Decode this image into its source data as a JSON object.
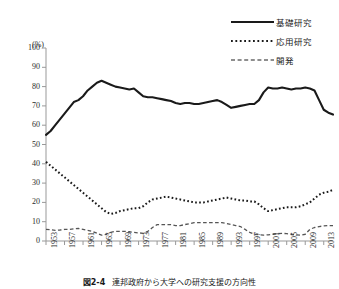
{
  "figure": {
    "caption_number": "図2-4",
    "caption_title": "連邦政府から大学への研究支援の方向性",
    "axis_unit": "(%)"
  },
  "legend": {
    "position": "top-right",
    "items": [
      {
        "label": "基礎研究",
        "style": "solid",
        "color": "#1a1a1a"
      },
      {
        "label": "応用研究",
        "style": "dotted",
        "color": "#1a1a1a"
      },
      {
        "label": "開発",
        "style": "dashed",
        "color": "#555555"
      }
    ]
  },
  "chart_data": {
    "type": "line",
    "title": "連邦政府から大学への研究支援の方向性",
    "xlabel": "",
    "ylabel": "(%)",
    "ylim": [
      0,
      100
    ],
    "yticks": [
      0,
      10,
      20,
      30,
      40,
      50,
      60,
      70,
      80,
      90,
      100
    ],
    "xlim": [
      1953,
      2015
    ],
    "xticks": [
      1953,
      1957,
      1961,
      1965,
      1969,
      1973,
      1977,
      1981,
      1985,
      1989,
      1993,
      1997,
      2001,
      2005,
      2009,
      2013
    ],
    "xtick_labels": [
      "1953",
      "1957",
      "1961",
      "1965",
      "1969",
      "1973",
      "1977",
      "1981",
      "1985",
      "1989",
      "1993",
      "1997",
      "2001",
      "2005",
      "2009",
      "2013"
    ],
    "grid": false,
    "legend_position": "top-right",
    "x": [
      1953,
      1954,
      1955,
      1956,
      1957,
      1958,
      1959,
      1960,
      1961,
      1962,
      1963,
      1964,
      1965,
      1966,
      1967,
      1968,
      1969,
      1970,
      1971,
      1972,
      1973,
      1974,
      1975,
      1976,
      1977,
      1978,
      1979,
      1980,
      1981,
      1982,
      1983,
      1984,
      1985,
      1986,
      1987,
      1988,
      1989,
      1990,
      1991,
      1992,
      1993,
      1994,
      1995,
      1996,
      1997,
      1998,
      1999,
      2000,
      2001,
      2002,
      2003,
      2004,
      2005,
      2006,
      2007,
      2008,
      2009,
      2010,
      2011,
      2012,
      2013,
      2014,
      2015
    ],
    "series": [
      {
        "name": "基礎研究",
        "style": "solid",
        "color": "#1a1a1a",
        "values": [
          55,
          57,
          60,
          63,
          66,
          69,
          72,
          73,
          75,
          78,
          80,
          82,
          83,
          82,
          81,
          80,
          79.5,
          79,
          78.5,
          79,
          77,
          75,
          74.5,
          74.5,
          74,
          73.5,
          73,
          72.5,
          71.5,
          71,
          71.5,
          71.5,
          71,
          71,
          71.5,
          72,
          72.5,
          73,
          72,
          70.5,
          69,
          69.5,
          70,
          70.5,
          71,
          71,
          73,
          77,
          79.5,
          79,
          79,
          79.5,
          79,
          78.5,
          79,
          79,
          79.5,
          79,
          78,
          73,
          68,
          66.5,
          65.5
        ]
      },
      {
        "name": "応用研究",
        "style": "dotted",
        "color": "#1a1a1a",
        "values": [
          41,
          39,
          37,
          35,
          33,
          31,
          29,
          27,
          25,
          23,
          21,
          19,
          17,
          15,
          14,
          14.5,
          15.5,
          16,
          16.5,
          17,
          17,
          18,
          20,
          21.5,
          22,
          22.5,
          23,
          22.5,
          22,
          21.5,
          21,
          20.5,
          20,
          20,
          20,
          20.5,
          21,
          21.5,
          22,
          22.5,
          22,
          21.5,
          21,
          21,
          20.5,
          20.5,
          19,
          17,
          15.5,
          16,
          16.5,
          17,
          17.5,
          17.5,
          17.5,
          18,
          19,
          20,
          22,
          24,
          25,
          25.5,
          26.5
        ]
      },
      {
        "name": "開発",
        "style": "dashed",
        "color": "#555555",
        "values": [
          6,
          5.8,
          5.5,
          5.7,
          6,
          6,
          6.3,
          6.5,
          6,
          5.5,
          5,
          4,
          3,
          3.5,
          4.5,
          5,
          5,
          5,
          4.8,
          4.5,
          4.2,
          4,
          5,
          7,
          8.5,
          8.5,
          8.5,
          8.5,
          8,
          8,
          8.5,
          9,
          9.5,
          9.5,
          9.5,
          9.5,
          9.5,
          9.5,
          9.5,
          9,
          8.5,
          8,
          7.5,
          6,
          4.5,
          3.5,
          3.2,
          3,
          3.2,
          3.5,
          3.8,
          4,
          3.8,
          3.5,
          3.2,
          3,
          3.5,
          6,
          7,
          7.5,
          7.8,
          8,
          8
        ]
      }
    ]
  }
}
